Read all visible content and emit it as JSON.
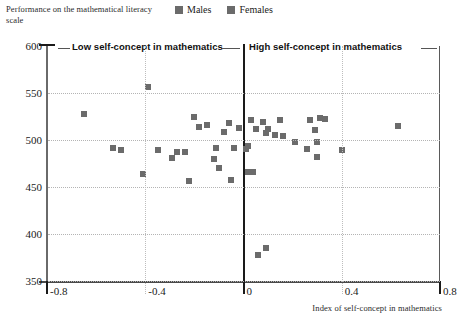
{
  "axis_caption": "Performance on the mathematical literacy scale",
  "legend": {
    "items": [
      {
        "label": "Males",
        "color": "#6b6b6b",
        "icon": "square-marker-icon"
      },
      {
        "label": "Females",
        "color": "#6b6b6b",
        "icon": "square-marker-icon"
      }
    ]
  },
  "annotations": {
    "left_band": "Low self-concept in mathematics",
    "right_band": "High self-concept in mathematics"
  },
  "chart_data": {
    "type": "scatter",
    "title": "",
    "xlabel": "Index of self-concept in mathematics",
    "ylabel": "Performance on the mathematical literacy scale",
    "xlim": [
      -0.8,
      0.8
    ],
    "ylim": [
      350,
      600
    ],
    "xticks": [
      "-0.8",
      "-0.4",
      "0",
      "0.4",
      "0.8"
    ],
    "xtick_values": [
      -0.8,
      -0.4,
      0,
      0.4,
      0.8
    ],
    "yticks": [
      "600",
      "550",
      "500",
      "450",
      "400",
      "350"
    ],
    "ytick_values": [
      600,
      550,
      500,
      450,
      400,
      350
    ],
    "grid": "dotted",
    "legend_position": "top-center",
    "marker": "square",
    "marker_color": "#6b6b6b",
    "series": [
      {
        "name": "Males",
        "color": "#6b6b6b",
        "points": [
          {
            "x": -0.39,
            "y": 556
          },
          {
            "x": -0.65,
            "y": 528
          },
          {
            "x": -0.2,
            "y": 524
          },
          {
            "x": -0.15,
            "y": 516
          },
          {
            "x": -0.18,
            "y": 514
          },
          {
            "x": -0.06,
            "y": 518
          },
          {
            "x": -0.08,
            "y": 509
          },
          {
            "x": -0.02,
            "y": 513
          },
          {
            "x": -0.53,
            "y": 491
          },
          {
            "x": -0.5,
            "y": 489
          },
          {
            "x": -0.35,
            "y": 489
          },
          {
            "x": -0.27,
            "y": 487
          },
          {
            "x": -0.24,
            "y": 487
          },
          {
            "x": -0.11,
            "y": 492
          },
          {
            "x": -0.04,
            "y": 491
          },
          {
            "x": -0.41,
            "y": 464
          },
          {
            "x": -0.29,
            "y": 481
          },
          {
            "x": -0.12,
            "y": 480
          },
          {
            "x": -0.1,
            "y": 470
          },
          {
            "x": -0.22,
            "y": 456
          },
          {
            "x": -0.05,
            "y": 457
          },
          {
            "x": 0.03,
            "y": 521
          },
          {
            "x": 0.05,
            "y": 512
          },
          {
            "x": 0.08,
            "y": 519
          },
          {
            "x": 0.1,
            "y": 512
          },
          {
            "x": 0.09,
            "y": 507
          },
          {
            "x": 0.15,
            "y": 521
          },
          {
            "x": 0.13,
            "y": 505
          },
          {
            "x": 0.16,
            "y": 504
          },
          {
            "x": 0.21,
            "y": 498
          },
          {
            "x": 0.02,
            "y": 494
          },
          {
            "x": 0.01,
            "y": 490
          },
          {
            "x": 0.26,
            "y": 490
          },
          {
            "x": 0.27,
            "y": 521
          },
          {
            "x": 0.31,
            "y": 523
          },
          {
            "x": 0.33,
            "y": 522
          },
          {
            "x": 0.29,
            "y": 511
          },
          {
            "x": 0.3,
            "y": 498
          },
          {
            "x": 0.3,
            "y": 482
          },
          {
            "x": 0.4,
            "y": 489
          },
          {
            "x": 0.63,
            "y": 515
          },
          {
            "x": 0.02,
            "y": 466
          },
          {
            "x": 0.04,
            "y": 466
          },
          {
            "x": 0.09,
            "y": 385
          },
          {
            "x": 0.06,
            "y": 378
          }
        ]
      }
    ]
  }
}
